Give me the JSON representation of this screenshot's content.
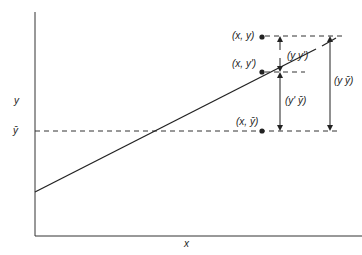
{
  "diagram": {
    "type": "regression-deviation-diagram",
    "axes": {
      "x_label": "x",
      "y_label": "y",
      "mean_label": "ȳ"
    },
    "points": [
      {
        "label": "(x, y)"
      },
      {
        "label": "(x, y')"
      },
      {
        "label": "(x, ȳ)"
      }
    ],
    "deviations": [
      {
        "label": "(y y')",
        "meaning": "residual"
      },
      {
        "label": "(y' ȳ)",
        "meaning": "explained"
      },
      {
        "label": "(y ȳ)",
        "meaning": "total"
      }
    ],
    "colors": {
      "line": "#222222",
      "dash": "#333333",
      "text": "#222222"
    }
  }
}
